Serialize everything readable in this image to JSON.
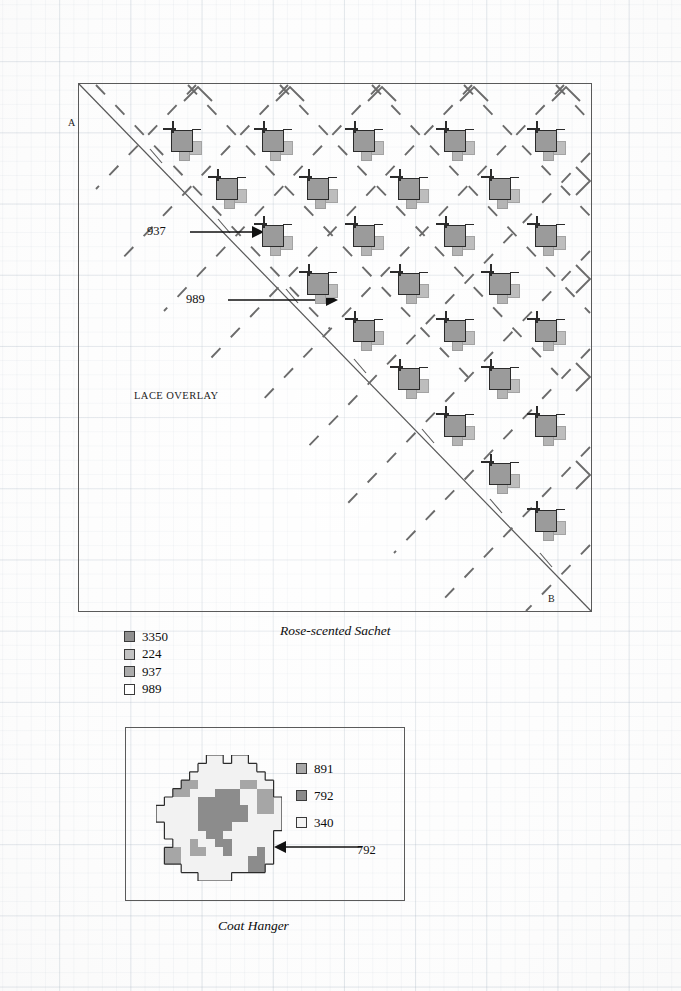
{
  "background": {
    "type": "graph-paper",
    "grid_color": "#c8d0d8"
  },
  "main_diagram": {
    "corner_labels": {
      "a": "A",
      "b": "B"
    },
    "area_label": "LACE OVERLAY",
    "annotations": [
      {
        "label": "937",
        "x": 147,
        "y": 224
      },
      {
        "label": "989",
        "x": 186,
        "y": 292
      }
    ],
    "motif_rows": [
      {
        "row": 0,
        "y": 42,
        "xs": [
          86,
          177,
          268,
          359,
          450
        ]
      },
      {
        "row": 1,
        "y": 90,
        "xs": [
          131,
          222,
          313,
          404
        ]
      },
      {
        "row": 2,
        "y": 137,
        "xs": [
          177,
          268,
          359,
          450
        ]
      },
      {
        "row": 3,
        "y": 185,
        "xs": [
          222,
          313,
          404
        ]
      },
      {
        "row": 4,
        "y": 232,
        "xs": [
          268,
          359,
          450
        ]
      },
      {
        "row": 5,
        "y": 280,
        "xs": [
          313,
          404
        ]
      },
      {
        "row": 6,
        "y": 327,
        "xs": [
          359,
          450
        ]
      },
      {
        "row": 7,
        "y": 375,
        "xs": [
          404
        ]
      },
      {
        "row": 8,
        "y": 422,
        "xs": [
          450
        ]
      }
    ],
    "motif_parts": [
      "dark-square-3350",
      "light-square-224",
      "small-square-937",
      "backstitch-cross"
    ]
  },
  "legend_main": {
    "title": "Rose-scented Sachet",
    "items": [
      {
        "code": "3350",
        "color": "#8f8f8f"
      },
      {
        "code": "224",
        "color": "#c2c2c2"
      },
      {
        "code": "937",
        "color": "#ababab"
      },
      {
        "code": "989",
        "color": "#ffffff"
      }
    ]
  },
  "coat_hanger": {
    "caption": "Coat Hanger",
    "annotation": "792",
    "legend": [
      {
        "code": "891",
        "color": "#a8a8a8"
      },
      {
        "code": "792",
        "color": "#8a8a8a"
      },
      {
        "code": "340",
        "color": "#f4f4f4"
      }
    ],
    "grid_size": 15,
    "palette": {
      "0": "none",
      "1": "#f2f2f2",
      "2": "#a6a6a6",
      "3": "#8c8c8c"
    },
    "grid": [
      [
        0,
        0,
        0,
        0,
        0,
        0,
        1,
        1,
        0,
        1,
        1,
        0,
        0,
        0,
        0
      ],
      [
        0,
        0,
        0,
        0,
        0,
        1,
        1,
        1,
        1,
        1,
        1,
        1,
        0,
        0,
        0
      ],
      [
        0,
        0,
        0,
        0,
        1,
        1,
        1,
        1,
        1,
        1,
        1,
        1,
        1,
        0,
        0
      ],
      [
        0,
        0,
        0,
        2,
        2,
        1,
        1,
        1,
        1,
        1,
        2,
        2,
        1,
        1,
        0
      ],
      [
        0,
        0,
        2,
        2,
        1,
        1,
        1,
        3,
        3,
        3,
        1,
        1,
        2,
        2,
        0
      ],
      [
        0,
        1,
        1,
        1,
        1,
        3,
        3,
        3,
        3,
        3,
        1,
        1,
        2,
        2,
        1
      ],
      [
        1,
        1,
        1,
        1,
        1,
        3,
        3,
        3,
        3,
        3,
        3,
        1,
        2,
        2,
        1
      ],
      [
        1,
        1,
        1,
        1,
        1,
        3,
        3,
        3,
        3,
        3,
        3,
        1,
        1,
        1,
        1
      ],
      [
        0,
        1,
        1,
        1,
        1,
        3,
        3,
        3,
        3,
        1,
        1,
        1,
        1,
        1,
        1
      ],
      [
        0,
        1,
        1,
        1,
        1,
        1,
        3,
        3,
        1,
        1,
        1,
        1,
        1,
        1,
        0
      ],
      [
        0,
        0,
        1,
        1,
        2,
        1,
        1,
        3,
        3,
        1,
        1,
        1,
        1,
        1,
        0
      ],
      [
        0,
        2,
        2,
        1,
        2,
        2,
        1,
        1,
        3,
        1,
        1,
        1,
        3,
        1,
        0
      ],
      [
        0,
        2,
        2,
        1,
        1,
        1,
        1,
        1,
        1,
        1,
        1,
        3,
        3,
        1,
        0
      ],
      [
        0,
        0,
        0,
        1,
        1,
        1,
        1,
        1,
        1,
        1,
        1,
        3,
        3,
        0,
        0
      ],
      [
        0,
        0,
        0,
        0,
        0,
        1,
        1,
        1,
        1,
        0,
        0,
        0,
        0,
        0,
        0
      ]
    ]
  }
}
